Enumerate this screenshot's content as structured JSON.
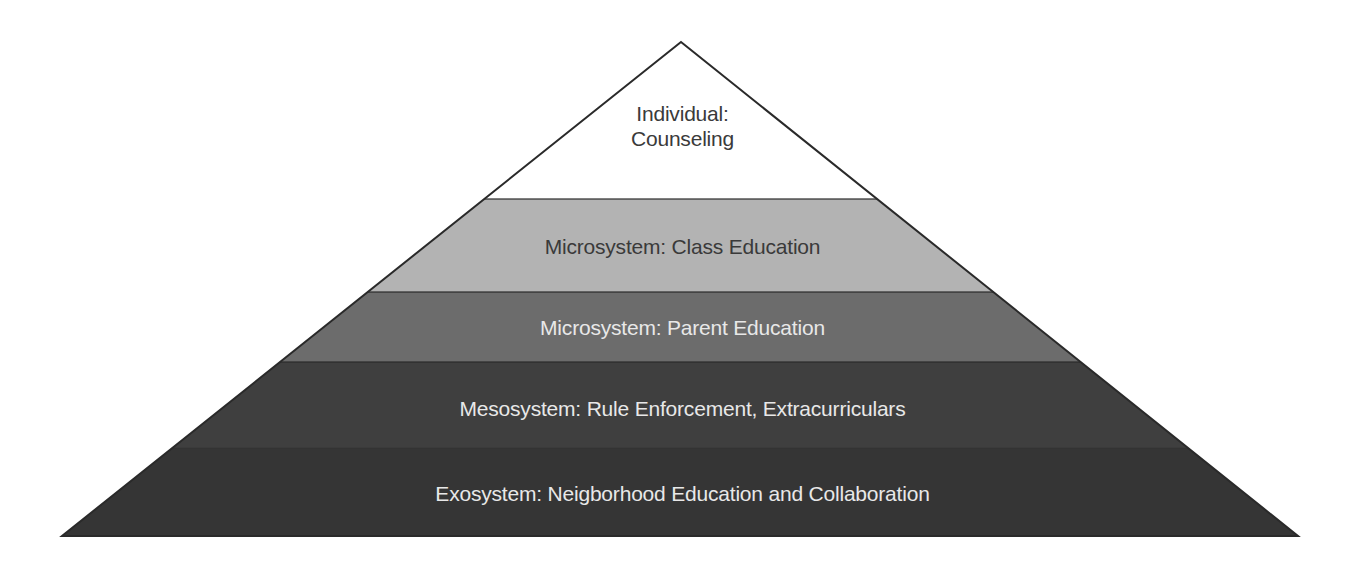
{
  "diagram": {
    "type": "pyramid",
    "apex": {
      "x": 681,
      "y": 42
    },
    "base": {
      "y": 536,
      "left_x": 62,
      "right_x": 1298
    },
    "tiers": [
      {
        "id": "individual",
        "label_line1": "Individual:",
        "label_line2": "Counseling",
        "y_top": 42,
        "y_bottom": 199,
        "fill": "#ffffff",
        "text_color": "#3a3a3a",
        "label_top": 101
      },
      {
        "id": "microsystem-class",
        "label": "Microsystem: Class Education",
        "y_top": 199,
        "y_bottom": 292,
        "fill": "#b3b3b3",
        "text_color": "#3a3a3a",
        "label_top": 234
      },
      {
        "id": "microsystem-parent",
        "label": "Microsystem: Parent Education",
        "y_top": 292,
        "y_bottom": 362,
        "fill": "#6c6c6c",
        "text_color": "#e8e8e8",
        "label_top": 315
      },
      {
        "id": "mesosystem",
        "label": "Mesosystem: Rule Enforcement, Extracurriculars",
        "y_top": 362,
        "y_bottom": 448,
        "fill": "#3f3f3f",
        "text_color": "#e8e8e8",
        "label_top": 396
      },
      {
        "id": "exosystem",
        "label": "Exosystem: Neigborhood Education and Collaboration",
        "y_top": 448,
        "y_bottom": 536,
        "fill": "#353535",
        "text_color": "#e8e8e8",
        "label_top": 481
      }
    ],
    "outline_color": "#2a2a2a"
  }
}
